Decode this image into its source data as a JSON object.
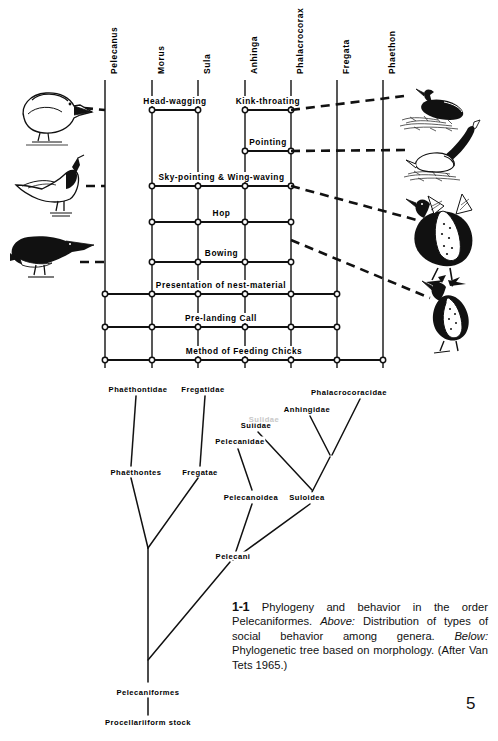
{
  "page": {
    "number": "5"
  },
  "figure": {
    "caption": {
      "number": "1-1",
      "text_1": " Phylogeny and behavior in the order Pelecaniformes. ",
      "em_1": "Above:",
      "text_2": " Distribution of types of social behavior among genera. ",
      "em_2": "Below:",
      "text_3": " Phylogenetic tree based on morphology. (After Van Tets 1965.)"
    }
  },
  "matrix": {
    "genera": [
      {
        "name": "Pelecanus",
        "x": 105
      },
      {
        "name": "Morus",
        "x": 152
      },
      {
        "name": "Sula",
        "x": 198
      },
      {
        "name": "Anhinga",
        "x": 245
      },
      {
        "name": "Phalacrocorax",
        "x": 291
      },
      {
        "name": "Fregata",
        "x": 337
      },
      {
        "name": "Phaethon",
        "x": 383
      }
    ],
    "behaviors": [
      {
        "label": "Head-wagging",
        "y": 110,
        "from": 1,
        "to": 2
      },
      {
        "label": "Kink-throating",
        "y": 110,
        "from": 3,
        "to": 4
      },
      {
        "label": "Pointing",
        "y": 151,
        "from": 3,
        "to": 4
      },
      {
        "label": "Sky-pointing & Wing-waving",
        "y": 186,
        "from": 1,
        "to": 4
      },
      {
        "label": "Hop",
        "y": 222,
        "from": 1,
        "to": 4
      },
      {
        "label": "Bowing",
        "y": 262,
        "from": 1,
        "to": 4
      },
      {
        "label": "Presentation of nest-material",
        "y": 294,
        "from": 0,
        "to": 5
      },
      {
        "label": "Pre-landing Call",
        "y": 327,
        "from": 0,
        "to": 5
      },
      {
        "label": "Method of Feeding Chicks",
        "y": 360,
        "from": 0,
        "to": 6
      }
    ]
  },
  "tree": {
    "labels": [
      {
        "text": "Phaëthontidae",
        "x": 138,
        "y": 389,
        "faint": false
      },
      {
        "text": "Fregatidae",
        "x": 203,
        "y": 389,
        "faint": false
      },
      {
        "text": "Phalacrocoracidae",
        "x": 349,
        "y": 392,
        "faint": false
      },
      {
        "text": "Anhingidae",
        "x": 307,
        "y": 409,
        "faint": false
      },
      {
        "text": "Sulidae",
        "x": 256,
        "y": 425,
        "faint": false
      },
      {
        "text": "Sulidae",
        "x": 264,
        "y": 419,
        "faint": true
      },
      {
        "text": "Pelecanidae",
        "x": 240,
        "y": 441,
        "faint": false
      },
      {
        "text": "Phaëthontes",
        "x": 136,
        "y": 472,
        "faint": false
      },
      {
        "text": "Fregatae",
        "x": 200,
        "y": 472,
        "faint": false
      },
      {
        "text": "Pelecanoidea",
        "x": 251,
        "y": 497,
        "faint": false
      },
      {
        "text": "Suloidea",
        "x": 307,
        "y": 497,
        "faint": false
      },
      {
        "text": "Pelecani",
        "x": 233,
        "y": 556,
        "faint": false
      },
      {
        "text": "Pelecaniformes",
        "x": 148,
        "y": 692,
        "faint": false
      },
      {
        "text": "Procellariiform stock",
        "x": 148,
        "y": 722,
        "faint": false
      }
    ]
  },
  "illustrations": {
    "left": [
      {
        "name": "pelican-head-wagging-bird"
      },
      {
        "name": "booby-sky-pointing-bird"
      },
      {
        "name": "cormorant-bowing-bird"
      }
    ],
    "right": [
      {
        "name": "cormorant-on-nest-bird"
      },
      {
        "name": "anhinga-kink-throating-bird"
      },
      {
        "name": "cormorant-wing-waving-bird"
      },
      {
        "name": "frigatebird-pointing-bird"
      }
    ]
  }
}
